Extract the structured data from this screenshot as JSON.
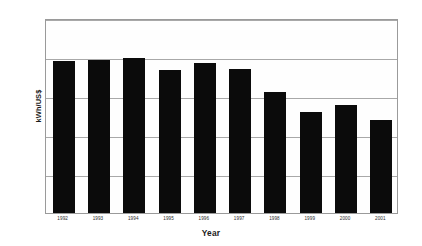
{
  "chart_data": {
    "type": "bar",
    "title": "",
    "subtitle": "",
    "xlabel": "Year",
    "ylabel": "kWh/US$",
    "categories": [
      "1992",
      "1993",
      "1994",
      "1995",
      "1996",
      "1997",
      "1998",
      "1999",
      "2000",
      "2001"
    ],
    "values": [
      1.95,
      1.96,
      1.99,
      1.83,
      1.92,
      1.84,
      1.55,
      1.3,
      1.39,
      1.19
    ],
    "series": [
      {
        "name": "kWh/US$",
        "values": [
          1.95,
          1.96,
          1.99,
          1.83,
          1.92,
          1.84,
          1.55,
          1.3,
          1.39,
          1.19
        ]
      }
    ],
    "ylim": [
      0.0,
      2.5
    ],
    "yticks": [
      "0.0",
      "0.5",
      "1.0",
      "1.5",
      "2.0",
      "2.5"
    ],
    "ytick_values": [
      0.0,
      0.5,
      1.0,
      1.5,
      2.0,
      2.5
    ],
    "grid": true,
    "grid_axis": "y",
    "legend": false,
    "legend_position": "none",
    "bar_color": "#0b0b0b",
    "plot_background": "#fefefe",
    "grid_color": "#a8a8a8",
    "frame_color": "#9a9a9a",
    "annotations": []
  }
}
